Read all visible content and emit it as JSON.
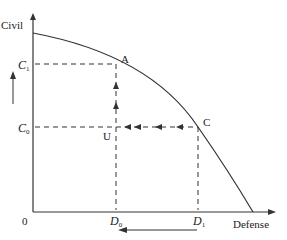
{
  "diagram": {
    "type": "production-possibilities-frontier",
    "colors": {
      "line": "#333333",
      "background": "#ffffff"
    },
    "axes": {
      "y_label": "Civil",
      "x_label": "Defense",
      "origin_label": "0"
    },
    "y_ticks": [
      {
        "base": "C",
        "sub": "1"
      },
      {
        "base": "C",
        "sub": "0"
      }
    ],
    "x_ticks": [
      {
        "base": "D",
        "sub": "0"
      },
      {
        "base": "D",
        "sub": "1"
      }
    ],
    "points": [
      {
        "label": "A"
      },
      {
        "label": "U"
      },
      {
        "label": "C"
      }
    ],
    "arrows": {
      "left_indicator": "up (civil output increases)",
      "bottom_indicator": "left (defense output decreases from D1 to D0)",
      "horizontal_path": "from C leftward to U",
      "vertical_path": "from U upward to A"
    }
  }
}
